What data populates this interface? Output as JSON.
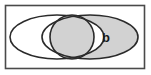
{
  "figure": {
    "name": "venn-diagram",
    "type": "set-diagram",
    "background_color": "#ffffff",
    "stroke_color": "#2b2b2b",
    "shade_color": "#d2d2d2",
    "unshaded_color": "#ffffff"
  },
  "universe": {
    "name": "universal-set-rectangle",
    "border_color": "#4a4a4a",
    "fill_color": "#ffffff",
    "x": 5,
    "y": 5,
    "width": 140,
    "height": 64
  },
  "sets": [
    {
      "id": "left-set",
      "label": "",
      "shape": "ellipse",
      "cx": 57,
      "cy": 37,
      "rx": 47,
      "ry": 22,
      "fill": "#ffffff",
      "shaded": false
    },
    {
      "id": "right-set",
      "label": "b",
      "shape": "ellipse",
      "cx": 90,
      "cy": 37,
      "rx": 48,
      "ry": 22,
      "fill": "#d2d2d2",
      "shaded": true
    },
    {
      "id": "middle-set",
      "label": "",
      "shape": "circle",
      "cx": 72,
      "cy": 37,
      "rx": 22,
      "ry": 22,
      "fill": "#d2d2d2",
      "shaded": true
    }
  ],
  "labels": [
    {
      "id": "label-b",
      "text": "b",
      "x": 106,
      "y": 41,
      "color": "#1a1a1a"
    }
  ]
}
